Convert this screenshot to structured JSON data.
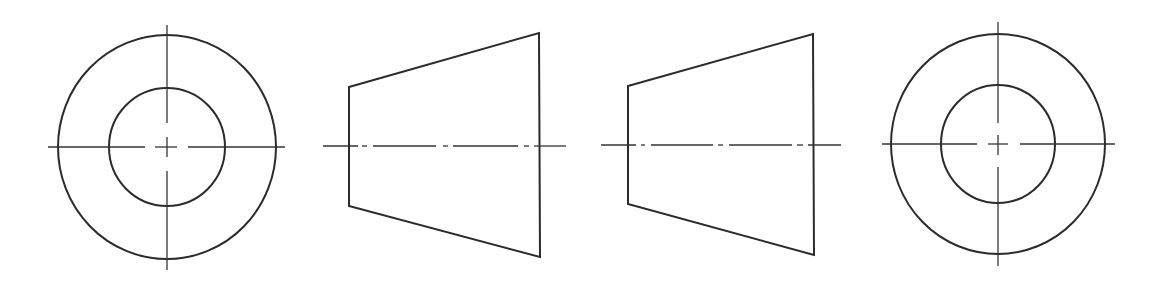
{
  "drawing": {
    "title": "Orthographic views of a truncated cone with center bore",
    "background": "#ffffff",
    "line_color": "#2b2b2b",
    "views": [
      {
        "id": "view-end-left",
        "type": "circular-end-view",
        "center": [
          167,
          147
        ],
        "outer_ellipse": {
          "rx": 109,
          "ry": 112
        },
        "inner_ellipse": {
          "rx": 58,
          "ry": 59
        },
        "centerline_h": {
          "x1": 48,
          "x2": 285,
          "y": 147,
          "segments": [
            [
              48,
              145
            ],
            [
              155,
              177
            ],
            [
              188,
              285
            ]
          ]
        },
        "centerline_v": {
          "y1": 25,
          "y2": 270,
          "x": 167,
          "segments": [
            [
              25,
              123
            ],
            [
              137,
              157
            ],
            [
              171,
              270
            ]
          ]
        }
      },
      {
        "id": "view-side-left",
        "type": "frustum-side-view",
        "points": [
          [
            349,
            87
          ],
          [
            539,
            33
          ],
          [
            540,
            257
          ],
          [
            349,
            206
          ]
        ],
        "axis": {
          "y": 146,
          "segments": [
            [
              323,
              358
            ],
            [
              362,
              367
            ],
            [
              373,
              436
            ],
            [
              443,
              448
            ],
            [
              453,
              518
            ],
            [
              524,
              529
            ],
            [
              534,
              566
            ]
          ]
        }
      },
      {
        "id": "view-side-right",
        "type": "frustum-side-view",
        "points": [
          [
            628,
            86
          ],
          [
            813,
            34
          ],
          [
            814,
            255
          ],
          [
            628,
            204
          ]
        ],
        "axis": {
          "y": 145,
          "segments": [
            [
              601,
              636
            ],
            [
              641,
              645
            ],
            [
              651,
              713
            ],
            [
              718,
              723
            ],
            [
              729,
              792
            ],
            [
              797,
              803
            ],
            [
              808,
              841
            ]
          ]
        }
      },
      {
        "id": "view-end-right",
        "type": "circular-end-view",
        "center": [
          998,
          144
        ],
        "outer_ellipse": {
          "rx": 107,
          "ry": 110
        },
        "inner_ellipse": {
          "rx": 57,
          "ry": 59
        },
        "centerline_h": {
          "x1": 882,
          "x2": 1115,
          "y": 144,
          "segments": [
            [
              882,
              977
            ],
            [
              988,
              1008
            ],
            [
              1020,
              1115
            ]
          ]
        },
        "centerline_v": {
          "y1": 22,
          "y2": 266,
          "x": 998,
          "segments": [
            [
              22,
              123
            ],
            [
              135,
              155
            ],
            [
              167,
              266
            ]
          ]
        }
      }
    ]
  }
}
